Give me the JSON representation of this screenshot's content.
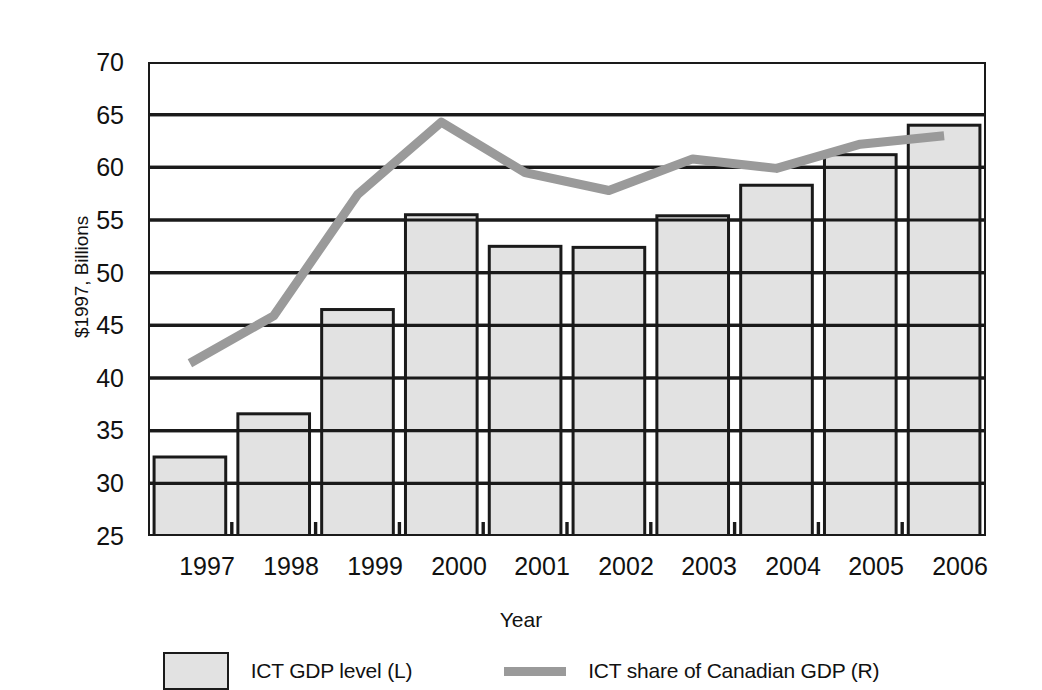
{
  "chart_data": {
    "type": "bar",
    "title": "",
    "subtitle": "",
    "xlabel": "Year",
    "ylabel": "$1997, Billions",
    "categories": [
      "1997",
      "1998",
      "1999",
      "2000",
      "2001",
      "2002",
      "2003",
      "2004",
      "2005",
      "2006"
    ],
    "ylim": [
      25,
      70
    ],
    "ytick_values": [
      25,
      30,
      35,
      40,
      45,
      50,
      55,
      60,
      65,
      70
    ],
    "ytick_labels": [
      "25",
      "30",
      "35",
      "40",
      "45",
      "50",
      "55",
      "60",
      "65",
      "70"
    ],
    "grid": "horizontal",
    "legend_position": "bottom",
    "series": [
      {
        "name": "ICT GDP level (L)",
        "type": "bar",
        "axis": "left",
        "color": "#e2e2e2",
        "edge_color": "#1a1a1a",
        "values": [
          32.5,
          36.6,
          46.5,
          55.5,
          52.5,
          52.4,
          55.4,
          58.3,
          61.2,
          64.0
        ]
      },
      {
        "name": "ICT share of Canadian GDP (R)",
        "type": "line",
        "axis": "right",
        "color": "#9a9a9a",
        "values": [
          41.4,
          45.9,
          57.4,
          64.3,
          59.5,
          57.8,
          60.8,
          59.9,
          62.2,
          63.0
        ]
      }
    ],
    "legend": [
      {
        "label": "ICT GDP level (L)",
        "marker": "filled-square",
        "color": "#e2e2e2"
      },
      {
        "label": "ICT share of Canadian GDP (R)",
        "marker": "line",
        "color": "#9a9a9a"
      }
    ]
  }
}
